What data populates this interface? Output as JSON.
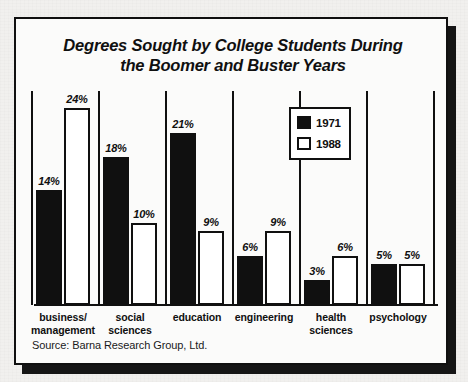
{
  "figure": {
    "title": "Degrees Sought by College Students During\nthe Boomer and Buster Years",
    "source_note": "Source: Barna Research Group, Ltd.",
    "frame_color": "#101010",
    "panel_color": "#fbfbfa",
    "shadow_color": "#151515"
  },
  "legend": {
    "entries": [
      {
        "label": "1971",
        "swatch": "filled-black-square-icon",
        "color": "#101010"
      },
      {
        "label": "1988",
        "swatch": "hollow-white-square-icon",
        "color": "#ffffff"
      }
    ]
  },
  "chart_data": {
    "type": "bar",
    "title": "Degrees Sought by College Students During the Boomer and Buster Years",
    "xlabel": "",
    "ylabel": "",
    "ylim": [
      0,
      24
    ],
    "grid": false,
    "legend_position": "inside-upper-right",
    "value_suffix": "%",
    "categories": [
      "business/\nmanagement",
      "social\nsciences",
      "education",
      "engineering",
      "health\nsciences",
      "psychology"
    ],
    "series": [
      {
        "name": "1971",
        "color": "#101010",
        "values": [
          14,
          18,
          21,
          6,
          3,
          5
        ]
      },
      {
        "name": "1988",
        "color": "#ffffff",
        "values": [
          24,
          10,
          9,
          9,
          6,
          5
        ]
      }
    ],
    "data_labels": {
      "1971": [
        "14%",
        "18%",
        "21%",
        "6%",
        "3%",
        "5%"
      ],
      "1988": [
        "24%",
        "10%",
        "9%",
        "9%",
        "6%",
        "5%"
      ]
    }
  }
}
